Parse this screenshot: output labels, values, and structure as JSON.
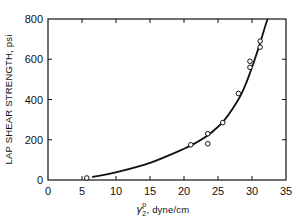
{
  "chart_data": {
    "type": "scatter",
    "title": "",
    "xlabel": "γ2p, dyne/cm",
    "xlabel_parts": {
      "symbol": "γ",
      "sub": "2",
      "sup": "p",
      "rest": ", dyne/cm"
    },
    "ylabel": "LAP SHEAR STRENGTH, psi",
    "xlim": [
      0,
      35
    ],
    "ylim": [
      0,
      800
    ],
    "x_ticks": [
      0,
      5,
      10,
      15,
      20,
      25,
      30,
      35
    ],
    "y_ticks": [
      0,
      200,
      400,
      600,
      800
    ],
    "grid": false,
    "legend": null,
    "series": [
      {
        "name": "measured",
        "marker": "open-circle",
        "points": [
          [
            5.7,
            10
          ],
          [
            21.0,
            175
          ],
          [
            23.5,
            230
          ],
          [
            23.5,
            180
          ],
          [
            25.7,
            285
          ],
          [
            28.0,
            430
          ],
          [
            29.7,
            590
          ],
          [
            29.7,
            560
          ],
          [
            31.2,
            690
          ],
          [
            31.2,
            660
          ]
        ]
      },
      {
        "name": "fitted curve",
        "marker": "none",
        "line": "solid",
        "points": [
          [
            6.5,
            15
          ],
          [
            10,
            38
          ],
          [
            15,
            85
          ],
          [
            20,
            155
          ],
          [
            22,
            190
          ],
          [
            24,
            235
          ],
          [
            26,
            300
          ],
          [
            28,
            400
          ],
          [
            29,
            470
          ],
          [
            30,
            560
          ],
          [
            31,
            660
          ],
          [
            32,
            770
          ],
          [
            32.3,
            800
          ]
        ]
      }
    ]
  }
}
